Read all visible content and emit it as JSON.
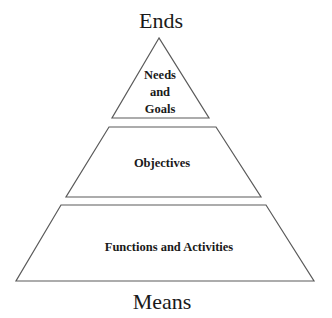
{
  "diagram": {
    "top_label": "Ends",
    "bottom_label": "Means",
    "levels": [
      {
        "name": "apex",
        "lines": [
          "Needs",
          "and",
          "Goals"
        ]
      },
      {
        "name": "middle",
        "lines": [
          "Objectives"
        ]
      },
      {
        "name": "base",
        "lines": [
          "Functions and Activities"
        ]
      }
    ],
    "colors": {
      "stroke": "#5a5a5a",
      "text": "#1a1a1a",
      "background": "#ffffff"
    }
  }
}
